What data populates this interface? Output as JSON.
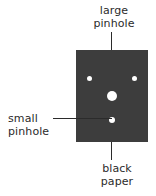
{
  "figure": {
    "background_color": "#ffffff",
    "paper_color": "#3d3d3d",
    "pinhole_color": "#ffffff",
    "text_color": "#2b2b2b",
    "leader_color": "#2b2b2b"
  },
  "labels": {
    "large_pinhole": "large\npinhole",
    "large_pinhole_line1": "large",
    "large_pinhole_line2": "pinhole",
    "small_pinhole_line1": "small",
    "small_pinhole_line2": "pinhole",
    "black_paper_line1": "black",
    "black_paper_line2": "paper"
  },
  "paper": {
    "label": "black paper",
    "x": 76,
    "y": 50,
    "width": 72,
    "height": 92
  },
  "pinholes": [
    {
      "name": "small-pinhole-upper-left",
      "size": "small",
      "cx": 89,
      "cy": 79,
      "diameter": 5
    },
    {
      "name": "small-pinhole-upper-right",
      "size": "small",
      "cx": 134,
      "cy": 79,
      "diameter": 5
    },
    {
      "name": "large-pinhole-center",
      "size": "large",
      "cx": 112,
      "cy": 96,
      "diameter": 10
    },
    {
      "name": "small-pinhole-bottom",
      "size": "small",
      "cx": 112,
      "cy": 120,
      "diameter": 6
    }
  ],
  "leaders": [
    {
      "name": "leader-large-pinhole",
      "orientation": "vertical",
      "from": [
        112,
        32
      ],
      "to": [
        112,
        92
      ]
    },
    {
      "name": "leader-small-pinhole",
      "orientation": "horizontal",
      "from": [
        53,
        119
      ],
      "to": [
        112,
        119
      ]
    },
    {
      "name": "leader-black-paper",
      "orientation": "vertical",
      "from": [
        112,
        142
      ],
      "to": [
        112,
        160
      ]
    }
  ]
}
